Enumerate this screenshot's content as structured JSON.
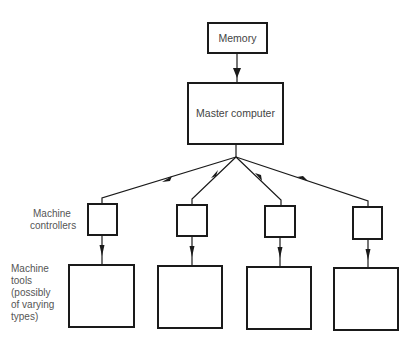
{
  "diagram": {
    "memory": {
      "label": "Memory"
    },
    "master": {
      "label": "Master computer"
    },
    "side_labels": {
      "controllers": [
        "Machine",
        "controllers"
      ],
      "tools": [
        "Machine",
        "tools",
        "(possibly",
        "of varying",
        "types)"
      ]
    },
    "controllers_count": 4,
    "tools_count": 4,
    "colors": {
      "stroke": "#1a1a1a",
      "text": "#444444",
      "background": "#ffffff"
    }
  }
}
